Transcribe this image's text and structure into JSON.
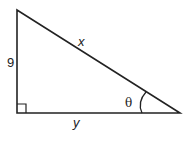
{
  "diagram": {
    "type": "right-triangle",
    "labels": {
      "vertical_side": "9",
      "hypotenuse": "x",
      "horizontal_side": "y",
      "angle": "θ"
    },
    "right_angle_marker": "bottom-left",
    "angle_location": "bottom-right",
    "stroke_color": "#222222",
    "background_color": "#ffffff"
  }
}
